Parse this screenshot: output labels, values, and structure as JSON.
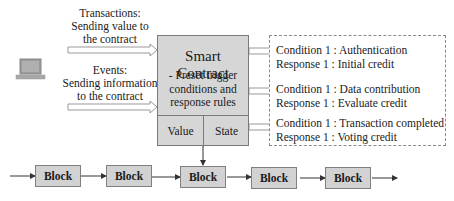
{
  "inputs": {
    "transactions": {
      "title": "Transactions:",
      "line1": "Sending value to",
      "line2": "the contract"
    },
    "events": {
      "title": "Events:",
      "line1": "Sending information",
      "line2": "to the contract"
    }
  },
  "device": {
    "icon": "laptop-icon"
  },
  "smart_contract": {
    "title": "Smart Contract",
    "desc_line1": "- Preset trigger",
    "desc_line2": "conditions and",
    "desc_line3": "response rules",
    "value_label": "Value",
    "state_label": "State"
  },
  "rules": [
    {
      "condition": "Condition 1 : Authentication",
      "response": "Response 1 : Initial credit"
    },
    {
      "condition": "Condition 1 : Data contribution",
      "response": "Response 1 : Evaluate credit"
    },
    {
      "condition": "Condition 1 : Transaction completed",
      "response": "Response 1 : Voting credit"
    }
  ],
  "blockchain": {
    "blocks": [
      "Block",
      "Block",
      "Block",
      "Block",
      "Block"
    ]
  },
  "colors": {
    "box_fill": "#d6d6d6",
    "block_fill": "#d2d2d2",
    "border": "#7a7a7a",
    "arrow": "#333333"
  }
}
